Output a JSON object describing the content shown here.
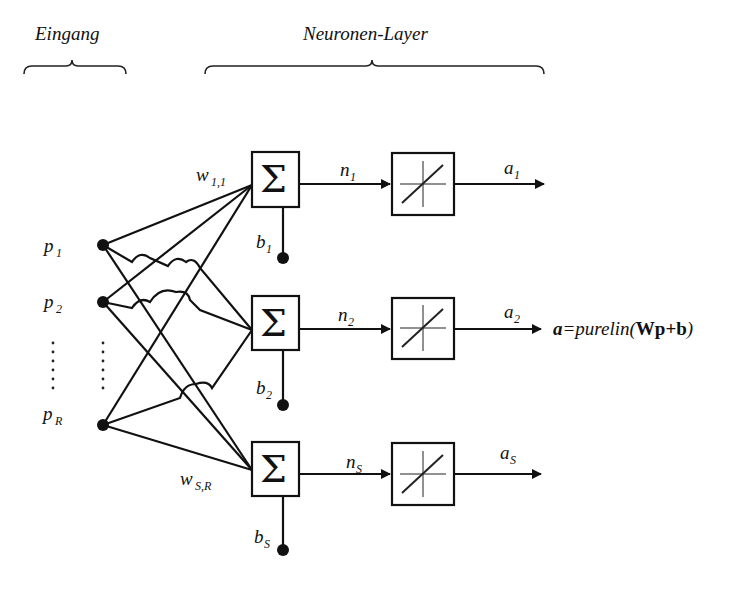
{
  "headers": {
    "input": "Eingang",
    "layer": "Neuronen-Layer"
  },
  "inputs": [
    {
      "name": "p",
      "sub": "1"
    },
    {
      "name": "p",
      "sub": "2"
    },
    {
      "name": "p",
      "sub": "R"
    }
  ],
  "weights": {
    "first": {
      "name": "w",
      "sub": "1,1"
    },
    "last": {
      "name": "w",
      "sub": "S,R"
    }
  },
  "neurons": [
    {
      "sum_symbol": "Σ",
      "bias": "b",
      "bias_sub": "1",
      "net": "n",
      "net_sub": "1",
      "out": "a",
      "out_sub": "1"
    },
    {
      "sum_symbol": "Σ",
      "bias": "b",
      "bias_sub": "2",
      "net": "n",
      "net_sub": "2",
      "out": "a",
      "out_sub": "2"
    },
    {
      "sum_symbol": "Σ",
      "bias": "b",
      "bias_sub": "S",
      "net": "n",
      "net_sub": "S",
      "out": "a",
      "out_sub": "S"
    }
  ],
  "formula": {
    "lhs": "a",
    "eq": "=",
    "func": "purelin(",
    "W": "W",
    "p": "p",
    "plus": "+",
    "b": "b",
    "close": ")"
  },
  "transfer_icon": "linear-transfer-icon",
  "colors": {
    "ink": "#111111",
    "background": "#ffffff"
  }
}
